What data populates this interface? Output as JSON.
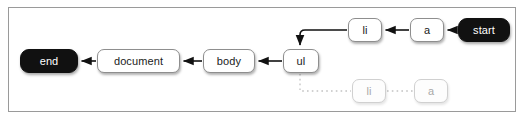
{
  "diagram": {
    "frame": {
      "border_color": "#9a9a9a",
      "background": "#ffffff"
    },
    "colors": {
      "terminal_fill": "#111111",
      "terminal_text": "#ffffff",
      "node_fill": "#ffffff",
      "node_border": "#8e8e8e",
      "node_text": "#1a1a1a",
      "faded_border": "#d0d0d0",
      "faded_text": "#a8a8a8",
      "edge_active": "#111111",
      "edge_faded": "#c2c2c2"
    },
    "nodes": [
      {
        "id": "end",
        "label": "end",
        "style": "terminal",
        "x": 20,
        "y": 49,
        "w": 58,
        "h": 24
      },
      {
        "id": "document",
        "label": "document",
        "style": "normal",
        "x": 97,
        "y": 49,
        "w": 83,
        "h": 24
      },
      {
        "id": "body",
        "label": "body",
        "style": "normal",
        "x": 203,
        "y": 49,
        "w": 52,
        "h": 24
      },
      {
        "id": "ul",
        "label": "ul",
        "style": "normal",
        "x": 283,
        "y": 49,
        "w": 36,
        "h": 24
      },
      {
        "id": "li_top",
        "label": "li",
        "style": "normal",
        "x": 348,
        "y": 18,
        "w": 34,
        "h": 24
      },
      {
        "id": "a_top",
        "label": "a",
        "style": "normal",
        "x": 410,
        "y": 18,
        "w": 34,
        "h": 24
      },
      {
        "id": "start",
        "label": "start",
        "style": "terminal",
        "x": 458,
        "y": 18,
        "w": 52,
        "h": 24
      },
      {
        "id": "li_bottom",
        "label": "li",
        "style": "faded",
        "x": 352,
        "y": 79,
        "w": 34,
        "h": 24
      },
      {
        "id": "a_bottom",
        "label": "a",
        "style": "faded",
        "x": 414,
        "y": 79,
        "w": 34,
        "h": 24
      }
    ],
    "edges": [
      {
        "id": "start-to-a",
        "from": "start",
        "to": "a_top",
        "kind": "solid",
        "arrow": true
      },
      {
        "id": "a-to-li",
        "from": "a_top",
        "to": "li_top",
        "kind": "solid",
        "arrow": true
      },
      {
        "id": "li-to-ul",
        "from": "li_top",
        "to": "ul",
        "kind": "elbow",
        "arrow": true
      },
      {
        "id": "ul-to-body",
        "from": "ul",
        "to": "body",
        "kind": "solid",
        "arrow": true
      },
      {
        "id": "body-to-document",
        "from": "body",
        "to": "document",
        "kind": "solid",
        "arrow": true
      },
      {
        "id": "document-to-end",
        "from": "document",
        "to": "end",
        "kind": "solid",
        "arrow": true
      },
      {
        "id": "ul-to-li-faded",
        "from": "ul",
        "to": "li_bottom",
        "kind": "dotted",
        "arrow": false
      },
      {
        "id": "li-to-a-faded",
        "from": "li_bottom",
        "to": "a_bottom",
        "kind": "dotted",
        "arrow": false
      }
    ]
  }
}
